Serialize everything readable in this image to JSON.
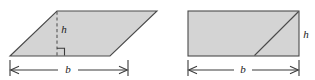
{
  "figure": {
    "type": "geometry-diagram",
    "background_color": "#ffffff",
    "shape_fill_color": "#d4d4d4",
    "shape_stroke_color": "#4a4a4a",
    "dimension_line_color": "#3a3a3a",
    "dashed_line_color": "#555555",
    "label_color": "#1a1a1a",
    "panels": [
      {
        "id": "parallelogram-panel",
        "shape": "parallelogram",
        "labels": {
          "height": "h",
          "base": "b"
        },
        "features": {
          "height_line_style": "dashed",
          "right_angle_marker": true,
          "base_dimension_line": true
        }
      },
      {
        "id": "rectangle-panel",
        "shape": "rectangle",
        "labels": {
          "height": "h",
          "base": "b"
        },
        "features": {
          "diagonal_line": true,
          "height_line_style": "none",
          "right_angle_marker": false,
          "base_dimension_line": true
        }
      }
    ]
  }
}
